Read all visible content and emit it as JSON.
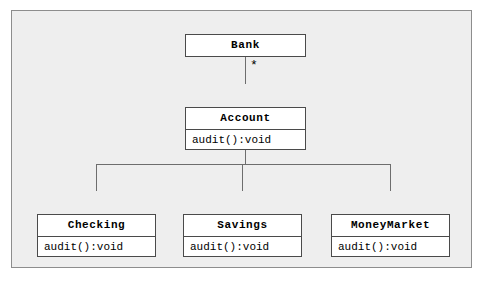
{
  "diagram": {
    "background_color": "#eeeeee",
    "frame_border_color": "#8d8d8d",
    "box_fill_color": "#ffffff",
    "box_border_color": "#4a4a4a",
    "line_color": "#6d6d6d",
    "classes": [
      {
        "name": "Bank",
        "operations": []
      },
      {
        "name": "Account",
        "operations": [
          "audit():void"
        ]
      },
      {
        "name": "Checking",
        "operations": [
          "audit():void"
        ]
      },
      {
        "name": "Savings",
        "operations": [
          "audit():void"
        ]
      },
      {
        "name": "MoneyMarket",
        "operations": [
          "audit():void"
        ]
      }
    ],
    "associations": [
      {
        "from": "Bank",
        "to": "Account",
        "source_multiplicity": "1",
        "target_multiplicity": "*"
      }
    ],
    "generalizations": [
      {
        "parent": "Account",
        "children": [
          "Checking",
          "Savings",
          "MoneyMarket"
        ]
      }
    ]
  }
}
